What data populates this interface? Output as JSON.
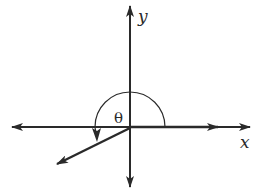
{
  "diagram": {
    "type": "angle-in-standard-position",
    "labels": {
      "x_axis": "x",
      "y_axis": "y",
      "angle": "θ"
    },
    "colors": {
      "stroke": "#2a2a2a",
      "background": "#ffffff"
    },
    "angle_description": "Angle θ in standard position with initial side on positive x-axis and terminal side in quadrant III"
  }
}
